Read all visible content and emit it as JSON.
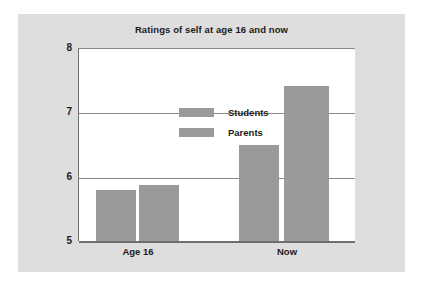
{
  "chart_data": {
    "type": "bar",
    "title": "Ratings of self at age 16 and now",
    "xlabel": "",
    "ylabel": "",
    "categories": [
      "Age 16",
      "Now"
    ],
    "series": [
      {
        "name": "Students",
        "values": [
          5.8,
          6.5
        ]
      },
      {
        "name": "Parents",
        "values": [
          5.88,
          7.42
        ]
      }
    ],
    "ylim": [
      5,
      8
    ],
    "yticks": [
      "5",
      "6",
      "7",
      "8"
    ],
    "grid": true,
    "legend_position": "top-left inside plot",
    "colors": {
      "bar": "#9a9a9a",
      "panel_background": "#dedede",
      "plot_background": "#ffffff",
      "axis": "#6e6e6e",
      "gridline": "#8a8a8a",
      "text": "#1b1b1b"
    }
  },
  "axes": {
    "yticks": {
      "t8": "8",
      "t7": "7",
      "t6": "6",
      "t5": "5"
    },
    "xticks": {
      "c0": "Age 16",
      "c1": "Now"
    }
  },
  "legend": {
    "items": [
      {
        "label": "Students"
      },
      {
        "label": "Parents"
      }
    ]
  }
}
